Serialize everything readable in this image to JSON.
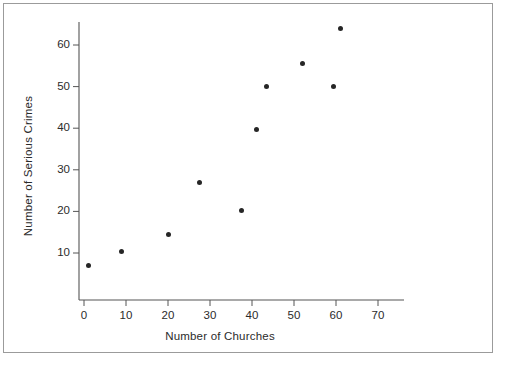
{
  "figure": {
    "background_color": "#ffffff",
    "frame_color": "#9b9b9b",
    "axis_color": "#555555",
    "point_color": "#262626",
    "text_color": "#2b2b2b"
  },
  "chart_data": {
    "type": "scatter",
    "title": "",
    "xlabel": "Number of Churches",
    "ylabel": "Number of Serious Crimes",
    "xlim": [
      -2,
      78
    ],
    "ylim": [
      0,
      68
    ],
    "grid": false,
    "legend": null,
    "xticks": [
      0,
      10,
      20,
      30,
      40,
      50,
      60,
      70
    ],
    "yticks": [
      10,
      20,
      30,
      40,
      50,
      60
    ],
    "xtick_labels": [
      "0",
      "10",
      "20",
      "30",
      "40",
      "50",
      "60",
      "70"
    ],
    "ytick_labels": [
      "10",
      "20",
      "30",
      "40",
      "50",
      "60"
    ],
    "points": [
      {
        "x": 1,
        "y": 7
      },
      {
        "x": 9,
        "y": 10.3
      },
      {
        "x": 20,
        "y": 14.5
      },
      {
        "x": 27.5,
        "y": 27
      },
      {
        "x": 37.5,
        "y": 20.3
      },
      {
        "x": 41,
        "y": 39.7
      },
      {
        "x": 43.5,
        "y": 50
      },
      {
        "x": 52,
        "y": 55.5
      },
      {
        "x": 59.5,
        "y": 50
      },
      {
        "x": 61,
        "y": 64
      }
    ]
  }
}
